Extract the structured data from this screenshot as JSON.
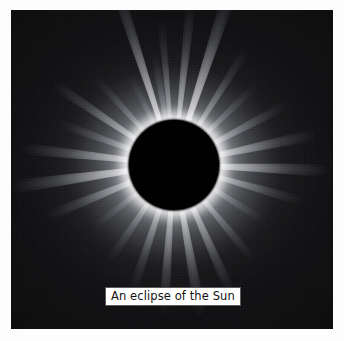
{
  "page": {
    "background_color": "#fdfdfd",
    "width": 344,
    "height": 341
  },
  "photo": {
    "name": "solar-eclipse-photograph",
    "subject": "total solar eclipse",
    "background_color": "#030303",
    "frame": {
      "left": 11,
      "top": 10,
      "width": 322,
      "height": 319
    },
    "occulting_disk": {
      "name": "lunar-disk",
      "color": "#000000",
      "center_x": 175,
      "center_y": 166,
      "radius": 45
    },
    "corona": {
      "name": "solar-corona",
      "highlight_color": "#ffffff",
      "halo_tint": "#f0f0f5",
      "rays": [
        {
          "angle_deg": -108,
          "length": 196,
          "thickness": 13,
          "intensity": 0.98
        },
        {
          "angle_deg": -95,
          "length": 150,
          "thickness": 9,
          "intensity": 0.8
        },
        {
          "angle_deg": -84,
          "length": 168,
          "thickness": 11,
          "intensity": 0.88
        },
        {
          "angle_deg": -72,
          "length": 188,
          "thickness": 15,
          "intensity": 1.0
        },
        {
          "angle_deg": -58,
          "length": 142,
          "thickness": 10,
          "intensity": 0.76
        },
        {
          "angle_deg": -44,
          "length": 120,
          "thickness": 9,
          "intensity": 0.66
        },
        {
          "angle_deg": -28,
          "length": 132,
          "thickness": 11,
          "intensity": 0.78
        },
        {
          "angle_deg": -12,
          "length": 150,
          "thickness": 13,
          "intensity": 0.86
        },
        {
          "angle_deg": 2,
          "length": 160,
          "thickness": 14,
          "intensity": 0.92
        },
        {
          "angle_deg": 16,
          "length": 138,
          "thickness": 11,
          "intensity": 0.8
        },
        {
          "angle_deg": 32,
          "length": 112,
          "thickness": 9,
          "intensity": 0.68
        },
        {
          "angle_deg": 50,
          "length": 128,
          "thickness": 10,
          "intensity": 0.74
        },
        {
          "angle_deg": 66,
          "length": 148,
          "thickness": 12,
          "intensity": 0.84
        },
        {
          "angle_deg": 80,
          "length": 160,
          "thickness": 13,
          "intensity": 0.88
        },
        {
          "angle_deg": 94,
          "length": 155,
          "thickness": 12,
          "intensity": 0.86
        },
        {
          "angle_deg": 108,
          "length": 138,
          "thickness": 11,
          "intensity": 0.78
        },
        {
          "angle_deg": 124,
          "length": 120,
          "thickness": 10,
          "intensity": 0.7
        },
        {
          "angle_deg": 142,
          "length": 106,
          "thickness": 9,
          "intensity": 0.62
        },
        {
          "angle_deg": 158,
          "length": 142,
          "thickness": 12,
          "intensity": 0.82
        },
        {
          "angle_deg": 172,
          "length": 170,
          "thickness": 15,
          "intensity": 0.95
        },
        {
          "angle_deg": 186,
          "length": 158,
          "thickness": 13,
          "intensity": 0.88
        },
        {
          "angle_deg": 200,
          "length": 126,
          "thickness": 10,
          "intensity": 0.72
        },
        {
          "angle_deg": 214,
          "length": 150,
          "thickness": 12,
          "intensity": 0.84
        },
        {
          "angle_deg": 228,
          "length": 122,
          "thickness": 9,
          "intensity": 0.68
        },
        {
          "angle_deg": 244,
          "length": 104,
          "thickness": 8,
          "intensity": 0.58
        },
        {
          "angle_deg": 260,
          "length": 118,
          "thickness": 9,
          "intensity": 0.64
        }
      ]
    }
  },
  "caption": {
    "name": "image-caption",
    "text": "An eclipse of the Sun",
    "text_color": "#121212",
    "background_color": "#ffffff",
    "border_color": "#5a5a5a"
  }
}
